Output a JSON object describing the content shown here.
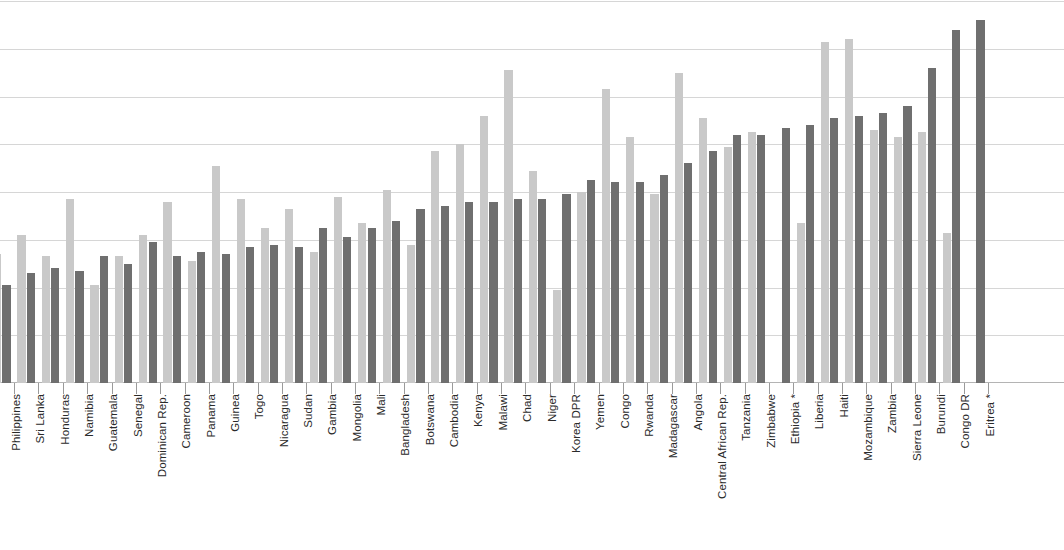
{
  "chart_data": {
    "type": "bar",
    "title": "",
    "subtitle": "",
    "xlabel": "",
    "ylabel": "",
    "grid": true,
    "legend_position": "none",
    "orientation": "vertical",
    "grouping": "grouped",
    "ylim": [
      0,
      80
    ],
    "y_gridlines": [
      10,
      20,
      30,
      40,
      50,
      60,
      70,
      80
    ],
    "y_tick_labels": [],
    "colors": {
      "series_0": "#c9c9c9",
      "series_1": "#6f6f6f",
      "gridline": "#d6d6d6",
      "axis": "#b4b4b4",
      "label": "#2a2a2a",
      "background": "#ffffff"
    },
    "note": "Leftmost category is clipped at the image edge; final category shows only the dark series.",
    "categories": [
      "Philippines",
      "Sri Lanka",
      "Honduras",
      "Namibia",
      "Guatemala",
      "Senegal",
      "Dominican Rep.",
      "Cameroon",
      "Panama",
      "Guinea",
      "Togo",
      "Nicaragua",
      "Sudan",
      "Gambia",
      "Mongolia",
      "Mali",
      "Bangladesh",
      "Botswana",
      "Cambodia",
      "Kenya",
      "Malawi",
      "Chad",
      "Niger",
      "Korea DPR",
      "Yemen",
      "Congo",
      "Rwanda",
      "Madagascar",
      "Angola",
      "Central African Rep.",
      "Tanzania",
      "Zimbabwe",
      "Ethiopia *",
      "Liberia",
      "Haiti",
      "Mozambique",
      "Zambia",
      "Sierra Leone",
      "Burundi",
      "Congo DR",
      "Eritrea *"
    ],
    "series": [
      {
        "name": "series_0",
        "color": "#c9c9c9",
        "values": [
          27.0,
          31.0,
          26.5,
          38.5,
          20.5,
          26.5,
          31.0,
          38.0,
          25.5,
          45.5,
          38.5,
          32.5,
          36.5,
          27.5,
          39.0,
          33.5,
          40.5,
          29.0,
          48.5,
          50.0,
          56.0,
          65.5,
          44.5,
          19.5,
          40.0,
          61.5,
          51.5,
          39.5,
          65.0,
          55.5,
          49.5,
          52.5,
          null,
          33.5,
          71.5,
          72.0,
          53.0,
          51.5,
          52.5,
          31.5,
          null
        ]
      },
      {
        "name": "series_1",
        "color": "#6f6f6f",
        "values": [
          20.5,
          23.0,
          24.0,
          23.5,
          26.5,
          25.0,
          29.5,
          26.5,
          27.5,
          27.0,
          28.5,
          29.0,
          28.5,
          32.5,
          30.5,
          32.5,
          34.0,
          36.5,
          37.0,
          38.0,
          38.0,
          38.5,
          38.5,
          39.5,
          42.5,
          42.0,
          42.0,
          43.5,
          46.0,
          48.5,
          52.0,
          52.0,
          53.5,
          54.0,
          55.5,
          56.0,
          56.5,
          58.0,
          66.0,
          74.0,
          76.0
        ]
      }
    ]
  },
  "axis": {
    "baseline_y": 383,
    "gridline_count": 8
  }
}
